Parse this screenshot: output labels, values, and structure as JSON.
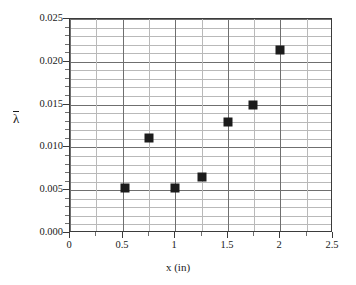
{
  "chart_data": {
    "type": "scatter",
    "title": "",
    "subtitle": "",
    "xlabel": "x (in)",
    "ylabel": "λ̄",
    "ylabel_glyph": "λ",
    "xlim": [
      0,
      2.5
    ],
    "ylim": [
      0.0,
      0.025
    ],
    "grid": true,
    "legend": null,
    "legend_position": "none",
    "x_major_step": 0.5,
    "x_minor_step": 0.25,
    "y_major_step": 0.005,
    "y_minor_step": 0.001,
    "x_tick_labels": [
      "0",
      "0.5",
      "1",
      "1.5",
      "2",
      "2.5"
    ],
    "x_tick_values": [
      0,
      0.5,
      1,
      1.5,
      2,
      2.5
    ],
    "y_tick_labels": [
      "0.000",
      "0.005",
      "0.010",
      "0.015",
      "0.020",
      "0.025"
    ],
    "y_tick_values": [
      0.0,
      0.005,
      0.01,
      0.015,
      0.02,
      0.025
    ],
    "marker": "square",
    "marker_color": "#1c1c1c",
    "marker_size_px": 9,
    "series": [
      {
        "name": "lambda-bar vs x",
        "points": [
          {
            "x": 0.52,
            "y": 0.0053
          },
          {
            "x": 0.75,
            "y": 0.0111
          },
          {
            "x": 1.0,
            "y": 0.0053
          },
          {
            "x": 1.25,
            "y": 0.0065
          },
          {
            "x": 1.5,
            "y": 0.013
          },
          {
            "x": 1.74,
            "y": 0.0149
          },
          {
            "x": 2.0,
            "y": 0.0214
          }
        ]
      }
    ],
    "colors": {
      "marker": "#1c1c1c",
      "axis": "#3b3b3b",
      "gridline_major": "#6f6f6f",
      "gridline_minor": "#b9b9b9",
      "background": "#ffffff",
      "text": "#1a1a1a"
    }
  }
}
